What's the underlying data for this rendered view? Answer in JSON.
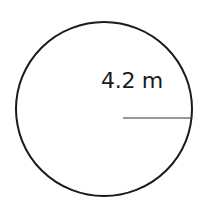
{
  "diagram": {
    "shape": "circle",
    "radius_label": "4.2 m",
    "radius_value": 4.2,
    "radius_unit": "m",
    "stroke_color": "#1a1a1a",
    "background_color": "#ffffff"
  }
}
